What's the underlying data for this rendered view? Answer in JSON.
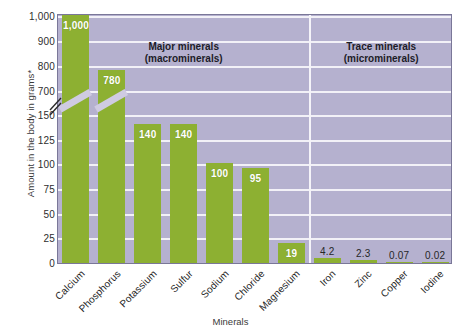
{
  "chart_data": {
    "type": "bar",
    "title": "",
    "xlabel": "Minerals",
    "ylabel": "Amount in the body in grams*",
    "categories": [
      "Calcium",
      "Phosphorus",
      "Potassium",
      "Sulfur",
      "Sodium",
      "Chloride",
      "Magnesium",
      "Iron",
      "Zinc",
      "Copper",
      "Iodine"
    ],
    "values": [
      1000,
      780,
      140,
      140,
      100,
      95,
      19,
      4.2,
      2.3,
      0.07,
      0.02
    ],
    "value_labels": [
      "1,000",
      "780",
      "140",
      "140",
      "100",
      "95",
      "19",
      "4.2",
      "2.3",
      "0.07",
      "0.02"
    ],
    "label_inside": [
      true,
      true,
      true,
      true,
      true,
      true,
      true,
      false,
      false,
      false,
      false
    ],
    "ytick_labels": [
      "1,000",
      "900",
      "800",
      "700",
      "150",
      "125",
      "100",
      "75",
      "50",
      "25",
      "0"
    ],
    "ytick_values": [
      1000,
      900,
      800,
      700,
      150,
      125,
      100,
      75,
      50,
      25,
      0
    ],
    "axis_break": true,
    "axis_break_between": [
      150,
      700
    ],
    "ylim": [
      0,
      1000
    ],
    "grid": true,
    "legend": "none",
    "bar_color": "#8db032",
    "plot_background_color": "#b5b1cf",
    "gridline_color": "#f2f1f7",
    "groups": [
      {
        "line1": "Major minerals",
        "line2": "(macrominerals)",
        "from": 0,
        "to": 6
      },
      {
        "line1": "Trace minerals",
        "line2": "(microminerals)",
        "from": 7,
        "to": 10
      }
    ]
  }
}
